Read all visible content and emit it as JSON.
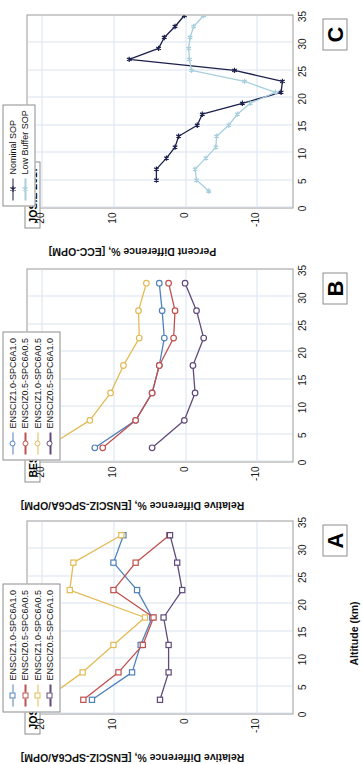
{
  "figure": {
    "orientation": "rotated-90-ccw",
    "shared_xaxis_title": "Altitude (km)",
    "altitude_ticks": [
      0,
      5,
      10,
      15,
      20,
      25,
      30,
      35
    ]
  },
  "colors": {
    "blue": "#4f81bd",
    "red": "#c0504d",
    "gold": "#e3bb55",
    "purple": "#604a7b",
    "navy": "#1b1f4b",
    "lightblue": "#a8cfdd",
    "grid": "#d9e4ef",
    "axis": "#9a9a9a",
    "text": "#111111"
  },
  "chart_data": [
    {
      "type": "line",
      "panel_letter": "A",
      "title": "JOSIE 2000",
      "xlabel": "Altitude (km)",
      "ylabel": "Relative Difference %, [ENSCIZ-SPC6A/OPM]",
      "xlim": [
        0,
        35
      ],
      "ylim": [
        -15,
        22
      ],
      "yticks": [
        -10,
        0,
        10,
        20
      ],
      "xticks": [
        0,
        5,
        10,
        15,
        20,
        25,
        30,
        35
      ],
      "grid": true,
      "legend_position": "top-left-outside",
      "marker": "square",
      "x": [
        32.5,
        27.5,
        22.5,
        17.5,
        12.5,
        7.5,
        2.5
      ],
      "series": [
        {
          "name": "ENSCIZ1.0-SPC6A1.0",
          "color": "#4f81bd",
          "values": [
            13.0,
            7.4,
            6.2,
            4.6,
            6.7,
            10.0,
            8.6
          ]
        },
        {
          "name": "ENSCIZ0.5-SPC6A0.5",
          "color": "#c0504d",
          "values": [
            14.2,
            9.3,
            5.9,
            4.4,
            10.0,
            6.9,
            2.2
          ]
        },
        {
          "name": "ENSCIZ1.0-SPC6A0.5",
          "color": "#e3bb55",
          "values": [
            19.6,
            14.3,
            10.0,
            5.6,
            16.1,
            15.6,
            8.9
          ]
        },
        {
          "name": "ENSCIZ0.5-SPC6A1.0",
          "color": "#604a7b",
          "values": [
            3.5,
            2.3,
            2.3,
            3.0,
            0.4,
            1.1,
            2.1
          ]
        }
      ]
    },
    {
      "type": "line",
      "panel_letter": "B",
      "title": "BESOS 2004",
      "xlabel": "Altitude (km)",
      "ylabel": "Relative Difference %, [ENSCIZ-SPC6A/OPM]",
      "xlim": [
        0,
        35
      ],
      "ylim": [
        -15,
        22
      ],
      "yticks": [
        -10,
        0,
        10,
        20
      ],
      "xticks": [
        0,
        5,
        10,
        15,
        20,
        25,
        30,
        35
      ],
      "grid": true,
      "legend_position": "top-left-outside",
      "marker": "circle",
      "x": [
        32.5,
        27.5,
        22.5,
        17.5,
        12.5,
        7.5,
        2.5
      ],
      "series": [
        {
          "name": "ENSCIZ1.0-SPC6A1.0",
          "color": "#4f81bd",
          "values": [
            12.6,
            6.9,
            4.6,
            3.6,
            2.9,
            3.2,
            3.6
          ]
        },
        {
          "name": "ENSCIZ0.5-SPC6A0.5",
          "color": "#c0504d",
          "values": [
            11.5,
            6.9,
            4.6,
            3.6,
            1.6,
            1.4,
            2.3
          ]
        },
        {
          "name": "ENSCIZ1.0-SPC6A0.5",
          "color": "#e3bb55",
          "values": [
            19.4,
            13.3,
            10.4,
            8.6,
            6.4,
            6.5,
            5.4
          ]
        },
        {
          "name": "ENSCIZ0.5-SPC6A1.0",
          "color": "#604a7b",
          "values": [
            4.6,
            0.1,
            -1.4,
            -1.1,
            -2.6,
            -1.6,
            0.0
          ]
        }
      ]
    },
    {
      "type": "line",
      "panel_letter": "C",
      "title": "JOSIE 2017",
      "xlabel": "Altitude (km)",
      "ylabel": "Percent Difference %, [ECC-OPM]",
      "xlim": [
        0,
        35
      ],
      "ylim": [
        -15,
        22
      ],
      "yticks": [
        -10,
        0,
        10,
        20
      ],
      "xticks": [
        0,
        5,
        10,
        15,
        20,
        25,
        30,
        35
      ],
      "grid": true,
      "legend_position": "top-left-outside",
      "marker": "star",
      "x": [
        32,
        30,
        28,
        26,
        24,
        22,
        20,
        18,
        16,
        14,
        12,
        10,
        8,
        6,
        4,
        2,
        0
      ],
      "series": [
        {
          "name": "Nominal SOP",
          "color": "#1b1f4b",
          "values": [
            null,
            4.0,
            4.0,
            2.6,
            1.4,
            0.9,
            -1.7,
            -2.4,
            -8.0,
            -13.4,
            -13.6,
            -6.9,
            7.8,
            3.7,
            2.9,
            1.4,
            0.1,
            -1.9
          ]
        },
        {
          "name": "Low Buffer SOP",
          "color": "#a8cfdd",
          "values": [
            -3.3,
            -1.6,
            -1.4,
            -2.9,
            -4.3,
            -4.4,
            -6.1,
            -7.3,
            -9.1,
            -12.6,
            -8.3,
            -0.9,
            -0.6,
            -0.5,
            -0.7,
            -1.2,
            -2.6,
            -4.3
          ]
        }
      ]
    }
  ],
  "panels": [
    {
      "id": "A",
      "letter": "A",
      "dataset_tag": "JOSIE 2000",
      "axis_title": "Relative Difference %, [ENSCIZ-SPC6A/OPM]",
      "xaxis_title": "Altitude (km)",
      "legend": [
        {
          "label": "ENSCIZ1.0-SPC6A1.0",
          "color": "#4f81bd"
        },
        {
          "label": "ENSCIZ0.5-SPC6A0.5",
          "color": "#c0504d"
        },
        {
          "label": "ENSCIZ1.0-SPC6A0.5",
          "color": "#e3bb55"
        },
        {
          "label": "ENSCIZ0.5-SPC6A1.0",
          "color": "#604a7b"
        }
      ]
    },
    {
      "id": "B",
      "letter": "B",
      "dataset_tag": "BESOS 2004",
      "axis_title": "Relative Difference %, [ENSCIZ-SPC6A/OPM]",
      "xaxis_title": "",
      "legend": [
        {
          "label": "ENSCIZ1.0-SPC6A1.0",
          "color": "#4f81bd"
        },
        {
          "label": "ENSCIZ0.5-SPC6A0.5",
          "color": "#c0504d"
        },
        {
          "label": "ENSCIZ1.0-SPC6A0.5",
          "color": "#e3bb55"
        },
        {
          "label": "ENSCIZ0.5-SPC6A1.0",
          "color": "#604a7b"
        }
      ]
    },
    {
      "id": "C",
      "letter": "C",
      "dataset_tag": "JOSIE 2017",
      "axis_title": "Percent Difference %, [ECC-OPM]",
      "xaxis_title": "",
      "legend": [
        {
          "label": "Nominal SOP",
          "color": "#1b1f4b"
        },
        {
          "label": "Low Buffer SOP",
          "color": "#a8cfdd"
        }
      ]
    }
  ],
  "ticklabels": {
    "x": [
      "35",
      "30",
      "25",
      "20",
      "15",
      "10",
      "5",
      "0"
    ],
    "y": [
      "-10",
      "0",
      "10",
      "20"
    ]
  }
}
